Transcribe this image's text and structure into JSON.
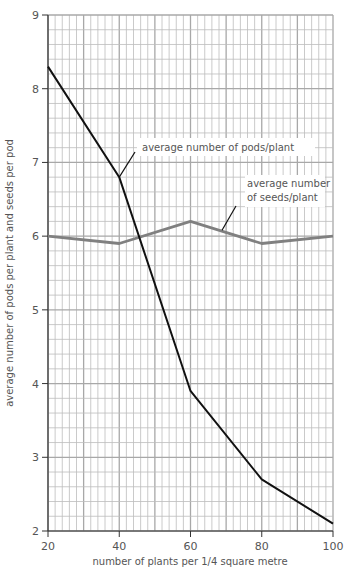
{
  "chart_data": {
    "type": "line",
    "title": "",
    "xlabel": "number of plants per 1/4 square metre",
    "ylabel": "average number of pods per plant and seeds per pod",
    "x": [
      20,
      40,
      60,
      80,
      100
    ],
    "xlim": [
      20,
      100
    ],
    "ylim": [
      2,
      9
    ],
    "x_ticks": [
      20,
      40,
      60,
      80,
      100
    ],
    "y_ticks": [
      2,
      3,
      4,
      5,
      6,
      7,
      8,
      9
    ],
    "grid": true,
    "series": [
      {
        "name": "average number of pods/plant",
        "values": [
          8.3,
          6.8,
          3.9,
          2.7,
          2.1
        ],
        "color": "#111111"
      },
      {
        "name": "average number of seeds/plant",
        "values": [
          6.0,
          5.9,
          6.2,
          5.9,
          6.0
        ],
        "color": "#808080"
      }
    ],
    "annotations": [
      {
        "text": "average number of pods/plant",
        "series": 0
      },
      {
        "text_lines": [
          "average number",
          "of seeds/plant"
        ],
        "series": 1
      }
    ],
    "legend": "inline labels with leader lines"
  }
}
